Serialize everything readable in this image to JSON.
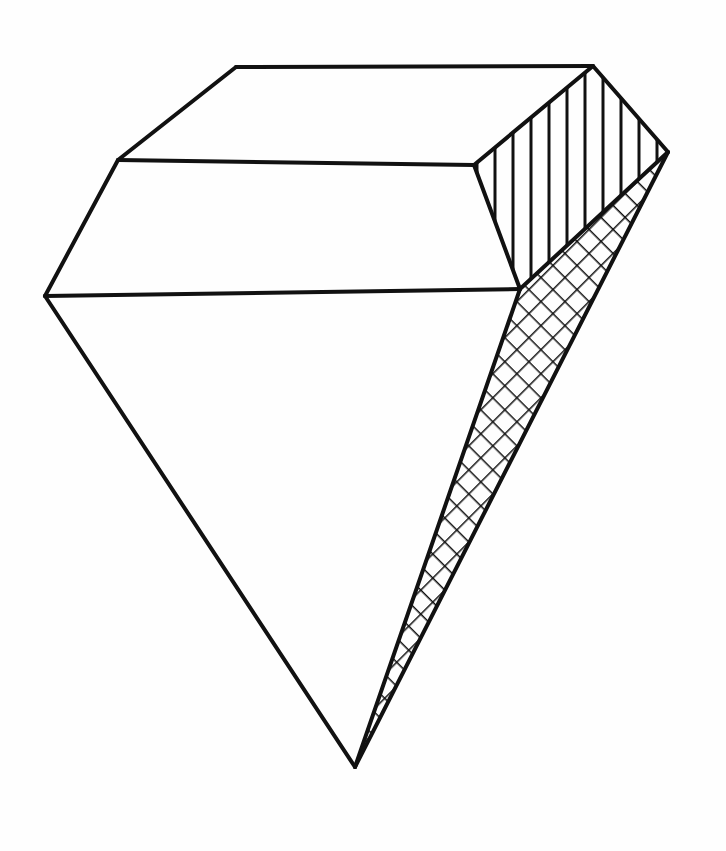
{
  "illustration": {
    "subject": "diamond",
    "style": "hand-drawn line art",
    "colors": {
      "stroke": "#111111",
      "background": "#fefefe"
    },
    "facets": [
      {
        "name": "table-top",
        "fill": "none"
      },
      {
        "name": "crown-band",
        "fill": "none"
      },
      {
        "name": "pavilion-front",
        "fill": "none"
      },
      {
        "name": "crown-right",
        "fill": "vertical-hatch"
      },
      {
        "name": "pavilion-right",
        "fill": "cross-hatch"
      }
    ]
  }
}
